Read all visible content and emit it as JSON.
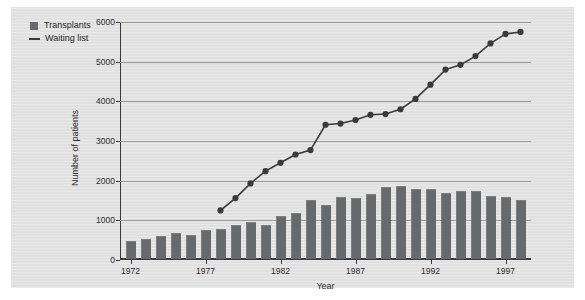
{
  "chart_data": {
    "type": "bar",
    "title": "",
    "subtitle": "",
    "xlabel": "Year",
    "ylabel": "Number of patients",
    "xlim": [
      1971.3,
      1998.7
    ],
    "ylim": [
      0,
      6000
    ],
    "grid": "horizontal",
    "legend_position": "top-left",
    "y_ticks": [
      "0",
      "1000",
      "2000",
      "3000",
      "4000",
      "5000",
      "6000"
    ],
    "y_tick_values": [
      0,
      1000,
      2000,
      3000,
      4000,
      5000,
      6000
    ],
    "x_ticks": [
      "1972",
      "1977",
      "1982",
      "1987",
      "1992",
      "1997"
    ],
    "x_tick_values": [
      1972,
      1977,
      1982,
      1987,
      1992,
      1997
    ],
    "categories": [
      1972,
      1973,
      1974,
      1975,
      1976,
      1977,
      1978,
      1979,
      1980,
      1981,
      1982,
      1983,
      1984,
      1985,
      1986,
      1987,
      1988,
      1989,
      1990,
      1991,
      1992,
      1993,
      1994,
      1995,
      1996,
      1997,
      1998
    ],
    "series": [
      {
        "name": "Transplants",
        "type": "bar",
        "color": "#666a6d",
        "x": [
          1972,
          1973,
          1974,
          1975,
          1976,
          1977,
          1978,
          1979,
          1980,
          1981,
          1982,
          1983,
          1984,
          1985,
          1986,
          1987,
          1988,
          1989,
          1990,
          1991,
          1992,
          1993,
          1994,
          1995,
          1996,
          1997,
          1998
        ],
        "values": [
          440,
          470,
          550,
          620,
          590,
          700,
          720,
          820,
          920,
          820,
          1050,
          1140,
          1460,
          1340,
          1530,
          1520,
          1610,
          1800,
          1820,
          1730,
          1740,
          1650,
          1700,
          1700,
          1570,
          1550,
          1450
        ]
      },
      {
        "name": "Waiting list",
        "type": "line",
        "color": "#3a3a3a",
        "marker": "filled-circle",
        "x": [
          1978,
          1979,
          1980,
          1981,
          1982,
          1983,
          1984,
          1985,
          1986,
          1987,
          1988,
          1989,
          1990,
          1991,
          1992,
          1993,
          1994,
          1995,
          1996,
          1997,
          1998
        ],
        "values": [
          1250,
          1560,
          1930,
          2240,
          2450,
          2660,
          2770,
          3410,
          3440,
          3530,
          3660,
          3680,
          3800,
          4060,
          4420,
          4800,
          4920,
          5140,
          5460,
          5700,
          5750
        ]
      }
    ]
  },
  "legend": {
    "items": [
      {
        "label": "Transplants",
        "swatch": "square-swatch"
      },
      {
        "label": "Waiting list",
        "swatch": "line-swatch"
      }
    ]
  },
  "axes": {
    "x_title": "Year",
    "y_title": "Number of patients"
  }
}
